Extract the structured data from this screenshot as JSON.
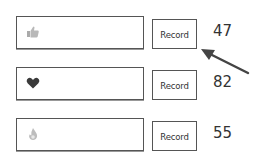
{
  "rows": [
    {
      "icon": "thumbs-up-icon",
      "button_label": "Record",
      "count": "47"
    },
    {
      "icon": "heart-icon",
      "button_label": "Record",
      "count": "82"
    },
    {
      "icon": "flame-icon",
      "button_label": "Record",
      "count": "55"
    }
  ],
  "annotation": {
    "arrow_color": "#444444"
  }
}
